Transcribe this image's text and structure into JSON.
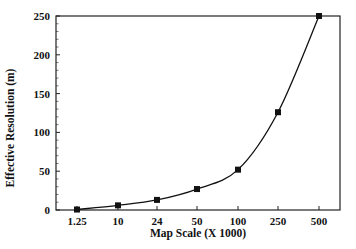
{
  "chart_data": {
    "type": "line",
    "title": "",
    "xlabel": "Map Scale (X 1000)",
    "ylabel": "Effective Resolution (m)",
    "categories": [
      "1.25",
      "10",
      "24",
      "50",
      "100",
      "250",
      "500"
    ],
    "series": [
      {
        "name": "Effective Resolution",
        "values": [
          0.6,
          6,
          13,
          27,
          52,
          126,
          250
        ],
        "marker": "square",
        "color": "#111111"
      }
    ],
    "ylim": [
      0,
      250
    ],
    "yticks": [
      0,
      50,
      100,
      150,
      200,
      250
    ],
    "grid": false,
    "legend": null,
    "minor_ticks": true
  },
  "colors": {
    "axis": "#222222",
    "line": "#111111",
    "background": "#ffffff"
  }
}
